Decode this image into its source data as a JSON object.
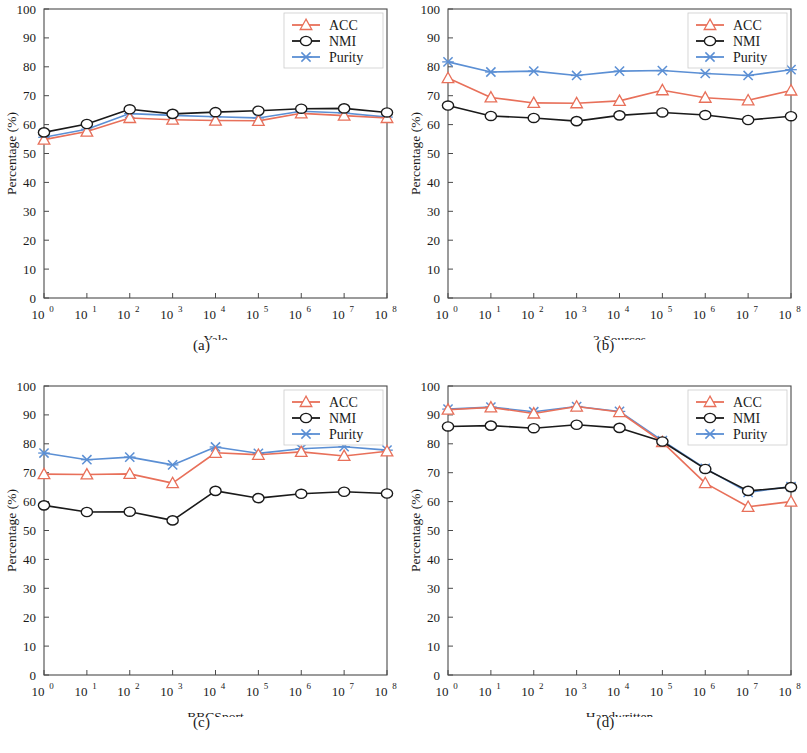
{
  "figure": {
    "width": 807,
    "height": 753,
    "background": "#ffffff"
  },
  "series_style": {
    "ACC": {
      "color": "#E8705A",
      "marker": "triangle-up-open",
      "legend_label": "ACC"
    },
    "NMI": {
      "color": "#1a1a1a",
      "marker": "circle-open",
      "legend_label": "NMI"
    },
    "Purity": {
      "color": "#5B8FD4",
      "marker": "x-cross",
      "legend_label": "Purity"
    }
  },
  "axis": {
    "y_label": "Percentage (%)",
    "y_ticks": [
      "0",
      "10",
      "20",
      "30",
      "40",
      "50",
      "60",
      "70",
      "80",
      "90",
      "100"
    ],
    "y_min": 0,
    "y_max": 100,
    "x_ticks": [
      {
        "base": "10",
        "exp": "0"
      },
      {
        "base": "10",
        "exp": "1"
      },
      {
        "base": "10",
        "exp": "2"
      },
      {
        "base": "10",
        "exp": "3"
      },
      {
        "base": "10",
        "exp": "4"
      },
      {
        "base": "10",
        "exp": "5"
      },
      {
        "base": "10",
        "exp": "6"
      },
      {
        "base": "10",
        "exp": "7"
      },
      {
        "base": "10",
        "exp": "8"
      }
    ]
  },
  "panels": [
    {
      "id": "a",
      "caption": "(a)",
      "xlabel": "Yale"
    },
    {
      "id": "b",
      "caption": "(b)",
      "xlabel": "3 Sources"
    },
    {
      "id": "c",
      "caption": "(c)",
      "xlabel": "BBCSport"
    },
    {
      "id": "d",
      "caption": "(d)",
      "xlabel": "Handwritten"
    }
  ],
  "chart_data": [
    {
      "type": "line",
      "panel": "a",
      "title": "",
      "xlabel": "Yale",
      "ylabel": "Percentage (%)",
      "xlim_exponents": [
        0,
        8
      ],
      "ylim": [
        0,
        100
      ],
      "grid": false,
      "legend_position": "top-right",
      "x": [
        "10^0",
        "10^1",
        "10^2",
        "10^3",
        "10^4",
        "10^5",
        "10^6",
        "10^7",
        "10^8"
      ],
      "categories": [
        "10^0",
        "10^1",
        "10^2",
        "10^3",
        "10^4",
        "10^5",
        "10^6",
        "10^7",
        "10^8"
      ],
      "series": [
        {
          "name": "ACC",
          "values": [
            54.8,
            57.6,
            62.3,
            61.7,
            61.4,
            61.3,
            63.9,
            63.1,
            62.3
          ]
        },
        {
          "name": "NMI",
          "values": [
            57.3,
            60.2,
            65.3,
            63.7,
            64.3,
            64.8,
            65.5,
            65.6,
            64.2
          ]
        },
        {
          "name": "Purity",
          "values": [
            55.6,
            58.4,
            63.8,
            63.2,
            62.7,
            62.3,
            64.6,
            64.0,
            62.6
          ]
        }
      ]
    },
    {
      "type": "line",
      "panel": "b",
      "title": "",
      "xlabel": "3 Sources",
      "ylabel": "Percentage (%)",
      "xlim_exponents": [
        0,
        8
      ],
      "ylim": [
        0,
        100
      ],
      "grid": false,
      "legend_position": "top-right",
      "x": [
        "10^0",
        "10^1",
        "10^2",
        "10^3",
        "10^4",
        "10^5",
        "10^6",
        "10^7",
        "10^8"
      ],
      "categories": [
        "10^0",
        "10^1",
        "10^2",
        "10^3",
        "10^4",
        "10^5",
        "10^6",
        "10^7",
        "10^8"
      ],
      "series": [
        {
          "name": "ACC",
          "values": [
            76.1,
            69.4,
            67.5,
            67.4,
            68.2,
            71.9,
            69.3,
            68.4,
            71.8
          ]
        },
        {
          "name": "NMI",
          "values": [
            66.6,
            63.0,
            62.3,
            61.2,
            63.2,
            64.2,
            63.3,
            61.6,
            62.9
          ]
        },
        {
          "name": "Purity",
          "values": [
            81.7,
            78.2,
            78.5,
            77.0,
            78.5,
            78.7,
            77.7,
            77.0,
            79.0
          ]
        }
      ]
    },
    {
      "type": "line",
      "panel": "c",
      "title": "",
      "xlabel": "BBCSport",
      "ylabel": "Percentage (%)",
      "xlim_exponents": [
        0,
        8
      ],
      "ylim": [
        0,
        100
      ],
      "grid": false,
      "legend_position": "top-right",
      "x": [
        "10^0",
        "10^1",
        "10^2",
        "10^3",
        "10^4",
        "10^5",
        "10^6",
        "10^7",
        "10^8"
      ],
      "categories": [
        "10^0",
        "10^1",
        "10^2",
        "10^3",
        "10^4",
        "10^5",
        "10^6",
        "10^7",
        "10^8"
      ],
      "series": [
        {
          "name": "ACC",
          "values": [
            69.5,
            69.4,
            69.6,
            66.4,
            76.9,
            76.2,
            77.2,
            75.8,
            77.4
          ]
        },
        {
          "name": "NMI",
          "values": [
            58.7,
            56.4,
            56.5,
            53.5,
            63.7,
            61.2,
            62.7,
            63.4,
            62.8
          ]
        },
        {
          "name": "Purity",
          "values": [
            76.8,
            74.5,
            75.4,
            72.7,
            78.9,
            76.7,
            78.3,
            79.0,
            77.8
          ]
        }
      ]
    },
    {
      "type": "line",
      "panel": "d",
      "title": "",
      "xlabel": "Handwritten",
      "ylabel": "Percentage (%)",
      "xlim_exponents": [
        0,
        8
      ],
      "ylim": [
        0,
        100
      ],
      "grid": false,
      "legend_position": "top-right",
      "x": [
        "10^0",
        "10^1",
        "10^2",
        "10^3",
        "10^4",
        "10^5",
        "10^6",
        "10^7",
        "10^8"
      ],
      "categories": [
        "10^0",
        "10^1",
        "10^2",
        "10^3",
        "10^4",
        "10^5",
        "10^6",
        "10^7",
        "10^8"
      ],
      "series": [
        {
          "name": "ACC",
          "values": [
            91.8,
            92.6,
            90.5,
            92.9,
            91.0,
            80.6,
            66.4,
            58.2,
            60.0
          ]
        },
        {
          "name": "NMI",
          "values": [
            86.0,
            86.3,
            85.4,
            86.6,
            85.5,
            80.8,
            71.3,
            63.7,
            65.0
          ]
        },
        {
          "name": "Purity",
          "values": [
            92.0,
            92.7,
            91.1,
            92.9,
            91.2,
            81.1,
            71.5,
            63.2,
            65.2
          ]
        }
      ]
    }
  ]
}
